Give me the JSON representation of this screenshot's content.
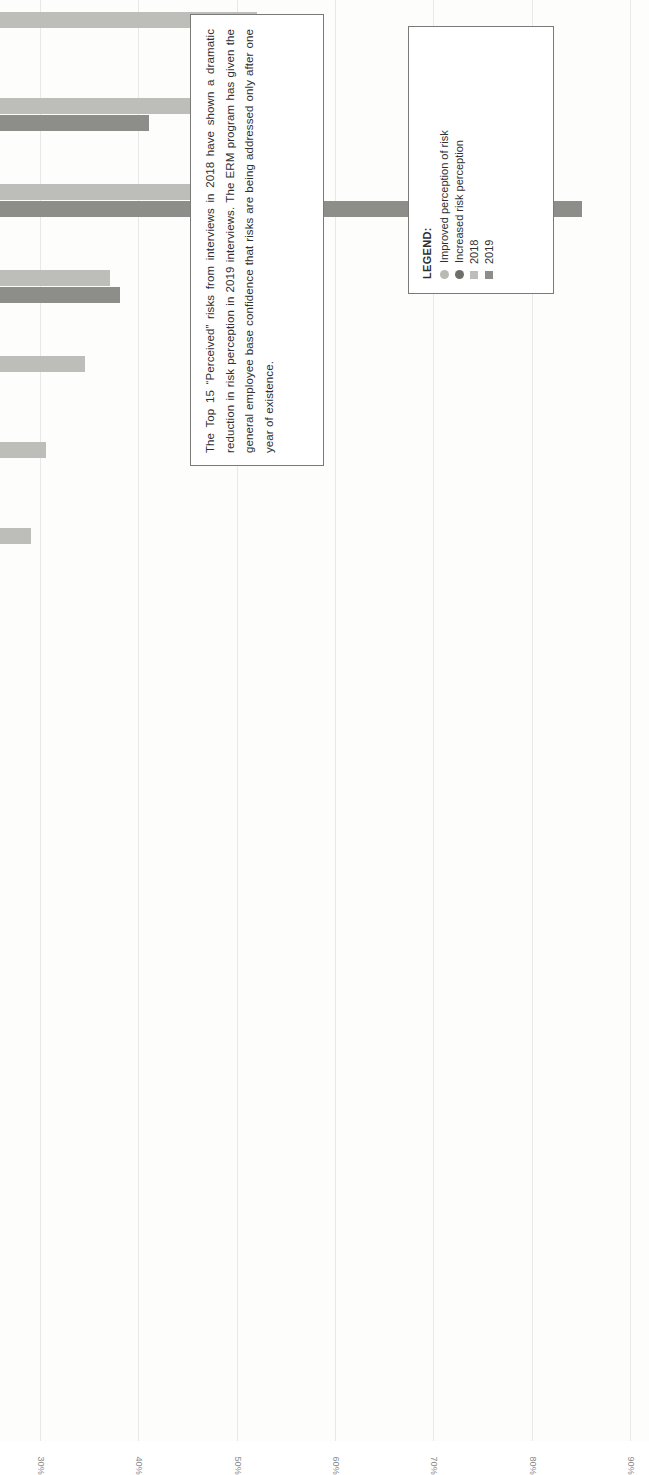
{
  "chart_data": {
    "type": "bar",
    "title": "",
    "orientation": "vertical-rotated",
    "xlabel": "",
    "ylabel": "",
    "ylim": [
      0,
      90
    ],
    "ytick_labels": [
      "0%",
      "10%",
      "20%",
      "30%",
      "40%",
      "50%",
      "60%",
      "70%",
      "80%",
      "90%"
    ],
    "ytick_values": [
      0,
      10,
      20,
      30,
      40,
      50,
      60,
      70,
      80,
      90
    ],
    "grid": true,
    "legend_position": "inside-top-right",
    "categories": [
      "Transformational Product Innovation",
      "Product Development Execution",
      "Employee Hiring & Retention",
      "Geopolitical Environment",
      "Product Quality & Reliability",
      "Business Continuity & Disaster Recovery Plan",
      "Short-Term Mindset",
      "Scalability for Rapid Growth",
      "External Supplier Relationships & Dependency (Supply Chain Disruption)",
      "Cybersecurity Breach",
      "Customer Centric Mindset",
      "Speed of MCO Margin & Growth",
      "Ethics & Governance (Fraud Risks)",
      "Stability and Competitiveness of Internal Fabric",
      "Inventory Management Controls & Systems"
    ],
    "series": [
      {
        "name": "2018",
        "color": "#bdbdb9",
        "values": [
          52,
          46.5,
          45.5,
          37,
          34.5,
          30.5,
          29,
          25.5,
          22,
          22,
          22,
          22,
          22,
          22,
          20
        ]
      },
      {
        "name": "2019",
        "color": "#8d8d89",
        "values": [
          24,
          41,
          85,
          38,
          17.5,
          9.5,
          12,
          24,
          17,
          7.5,
          17,
          17.5,
          17,
          18.5,
          11
        ]
      }
    ],
    "markers": [
      {
        "category": "Transformational Product Innovation",
        "type": "improved"
      },
      {
        "category": "Product Development Execution",
        "type": "improved"
      },
      {
        "category": "Employee Hiring & Retention",
        "type": "increased"
      },
      {
        "category": "Geopolitical Environment",
        "type": "none"
      },
      {
        "category": "Product Quality & Reliability",
        "type": "improved"
      },
      {
        "category": "Business Continuity & Disaster Recovery Plan",
        "type": "improved"
      },
      {
        "category": "Short-Term Mindset",
        "type": "improved"
      },
      {
        "category": "Scalability for Rapid Growth",
        "type": "improved"
      },
      {
        "category": "External Supplier Relationships & Dependency (Supply Chain Disruption)",
        "type": "improved"
      },
      {
        "category": "Cybersecurity Breach",
        "type": "improved"
      },
      {
        "category": "Customer Centric Mindset",
        "type": "improved"
      },
      {
        "category": "Speed of MCO Margin & Growth",
        "type": "improved"
      },
      {
        "category": "Ethics & Governance (Fraud Risks)",
        "type": "improved"
      },
      {
        "category": "Stability and Competitiveness of Internal Fabric",
        "type": "none"
      },
      {
        "category": "Inventory Management Controls & Systems",
        "type": "improved"
      }
    ]
  },
  "callout": {
    "text": "The Top 15 “Perceived” risks from interviews in 2018 have shown a dramatic reduction in risk perception in 2019 interviews.  The ERM program has given the general employee base confidence that risks are being addressed only after one year of existence."
  },
  "legend": {
    "title": "LEGEND:",
    "items": [
      {
        "label": "Improved perception of risk",
        "marker": "dot",
        "color": "#b9b9b5"
      },
      {
        "label": "Increased risk perception",
        "marker": "dot",
        "color": "#6e6e6a"
      },
      {
        "label": "2018",
        "marker": "square",
        "color": "#bdbdb9"
      },
      {
        "label": "2019",
        "marker": "square",
        "color": "#8d8d89"
      }
    ]
  }
}
